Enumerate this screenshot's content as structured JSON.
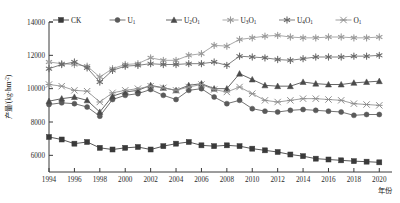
{
  "chart_data": {
    "type": "line",
    "title": "",
    "xlabel": "年份",
    "ylabel": "产量/(kg·hm-2)",
    "ylabel_main": "产量/(kg·hm",
    "ylabel_sup": "-2",
    "ylabel_tail": ")",
    "xlim": [
      1994,
      2021
    ],
    "ylim": [
      5000,
      14000
    ],
    "yticks": [
      6000,
      8000,
      10000,
      12000,
      14000
    ],
    "ytick_labels": [
      "6000",
      "8000",
      "10000",
      "12000",
      "14000"
    ],
    "xticks": [
      1994,
      1996,
      1998,
      2000,
      2002,
      2004,
      2006,
      2008,
      2010,
      2012,
      2014,
      2016,
      2018,
      2020
    ],
    "xtick_labels": [
      "1994",
      "1996",
      "1998",
      "2000",
      "2002",
      "2004",
      "2006",
      "2008",
      "2010",
      "2012",
      "2014",
      "2016",
      "2018",
      "2020"
    ],
    "grid": false,
    "legend_position": "top",
    "x": [
      1994,
      1995,
      1996,
      1997,
      1998,
      1999,
      2000,
      2001,
      2002,
      2003,
      2004,
      2005,
      2006,
      2007,
      2008,
      2009,
      2010,
      2011,
      2012,
      2013,
      2014,
      2015,
      2016,
      2017,
      2018,
      2019,
      2020
    ],
    "series": [
      {
        "name": "CK",
        "label_main": "CK",
        "label_sub": "",
        "marker": "square",
        "color": "#3a3a3a",
        "values": [
          7100,
          6950,
          6700,
          6800,
          6450,
          6350,
          6450,
          6500,
          6350,
          6550,
          6700,
          6800,
          6600,
          6550,
          6600,
          6550,
          6400,
          6300,
          6200,
          6050,
          5950,
          5800,
          5750,
          5700,
          5650,
          5620,
          5580
        ]
      },
      {
        "name": "U1",
        "label_main": "U",
        "label_sub": "1",
        "marker": "circle",
        "color": "#5a5a5a",
        "values": [
          9050,
          9150,
          9100,
          8900,
          8350,
          9350,
          9600,
          9700,
          9950,
          9600,
          9350,
          9900,
          10000,
          9500,
          9100,
          9300,
          8800,
          8650,
          8600,
          8700,
          8750,
          8700,
          8650,
          8600,
          8400,
          8450,
          8450
        ]
      },
      {
        "name": "U2O1",
        "label_main": "U",
        "label_sub": "2",
        "label_main2": "O",
        "label_sub2": "1",
        "marker": "triangle",
        "color": "#4a4a4a",
        "values": [
          9250,
          9400,
          9500,
          9300,
          8600,
          9550,
          9800,
          9900,
          10200,
          10050,
          9900,
          10200,
          10300,
          10000,
          10000,
          10900,
          10550,
          10200,
          10150,
          10150,
          10400,
          10300,
          10250,
          10250,
          10350,
          10400,
          10450
        ]
      },
      {
        "name": "U3O1",
        "label_main": "U",
        "label_sub": "3",
        "label_main2": "O",
        "label_sub2": "1",
        "marker": "star6-light",
        "color": "#9a9a9a",
        "values": [
          11600,
          11500,
          11450,
          11350,
          10700,
          11200,
          11450,
          11500,
          11850,
          11700,
          11700,
          12000,
          12100,
          12600,
          12550,
          12950,
          13050,
          13150,
          13200,
          13100,
          13050,
          13050,
          13100,
          13100,
          13050,
          13050,
          13100
        ]
      },
      {
        "name": "U4O1",
        "label_main": "U",
        "label_sub": "4",
        "label_main2": "O",
        "label_sub2": "1",
        "marker": "asterisk",
        "color": "#6a6a6a",
        "values": [
          11200,
          11450,
          11600,
          11250,
          10400,
          11100,
          11350,
          11400,
          11500,
          11450,
          11450,
          11500,
          11500,
          11600,
          11400,
          11950,
          11900,
          11850,
          11750,
          11700,
          11800,
          11900,
          11900,
          11900,
          11950,
          11950,
          12000
        ]
      },
      {
        "name": "O1",
        "label_main": "O",
        "label_sub": "1",
        "marker": "cross-star",
        "color": "#8f8f8f",
        "values": [
          10250,
          10150,
          9900,
          9850,
          9200,
          9750,
          9900,
          10000,
          10150,
          10050,
          9900,
          10100,
          10250,
          9950,
          9800,
          10100,
          9700,
          9300,
          9200,
          9300,
          9400,
          9400,
          9350,
          9300,
          9100,
          9050,
          9000
        ]
      }
    ]
  }
}
